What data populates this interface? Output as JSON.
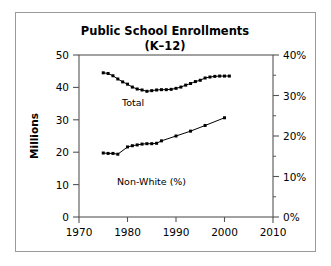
{
  "chart_data": {
    "type": "line",
    "title": "Public School Enrollments",
    "subtitle": "(K–12)",
    "xlabel": "",
    "ylabel": "Millions",
    "y2label": "",
    "xlim": [
      1970,
      2010
    ],
    "ylim": [
      0,
      50
    ],
    "y2lim": [
      0,
      40
    ],
    "grid": false,
    "legend_position": "inline-annotation",
    "xticks": [
      1970,
      1980,
      1990,
      2000,
      2010
    ],
    "xticklabels": [
      "1970",
      "1980",
      "1990",
      "2000",
      "2010"
    ],
    "yticks": [
      0,
      10,
      20,
      30,
      40,
      50
    ],
    "yticklabels": [
      "0",
      "10",
      "20",
      "30",
      "40",
      "50"
    ],
    "y2ticks": [
      0,
      10,
      20,
      30,
      40
    ],
    "y2ticklabels": [
      "0%",
      "10%",
      "20%",
      "30%",
      "40%"
    ],
    "y2minorticks": [
      5,
      15,
      25,
      35
    ],
    "annotations": [
      {
        "text": "Total",
        "x": 1979.0,
        "y": 35.2
      },
      {
        "text": "Non-White (%)",
        "x": 1981.5,
        "y": 14.2
      }
    ],
    "series": [
      {
        "name": "Total",
        "axis": "left",
        "units": "millions",
        "x": [
          1975,
          1976,
          1977,
          1978,
          1979,
          1980,
          1981,
          1982,
          1983,
          1984,
          1985,
          1986,
          1987,
          1988,
          1989,
          1990,
          1991,
          1992,
          1993,
          1994,
          1995,
          1996,
          1997,
          1998,
          1999,
          2000,
          2001
        ],
        "values": [
          44.5,
          44.3,
          43.6,
          42.6,
          41.7,
          41.0,
          40.1,
          39.5,
          39.2,
          38.8,
          39.0,
          39.2,
          39.3,
          39.3,
          39.4,
          39.7,
          40.1,
          40.7,
          41.2,
          41.8,
          42.2,
          42.9,
          43.2,
          43.4,
          43.5,
          43.5,
          43.5
        ]
      },
      {
        "name": "Non-White (%)",
        "axis": "right",
        "units": "percent",
        "x": [
          1975,
          1976,
          1977,
          1978,
          1980,
          1981,
          1982,
          1983,
          1984,
          1985,
          1986,
          1987,
          1990,
          1993,
          1996,
          2000
        ],
        "values": [
          15.8,
          15.7,
          15.7,
          15.5,
          17.3,
          17.6,
          17.8,
          18.0,
          18.1,
          18.1,
          18.2,
          18.8,
          20.0,
          21.2,
          22.6,
          24.5
        ]
      }
    ]
  },
  "figure": {
    "border_color": "#9a9a9a",
    "axis_color": "#555555",
    "data_color": "#000000",
    "background": "#ffffff"
  }
}
